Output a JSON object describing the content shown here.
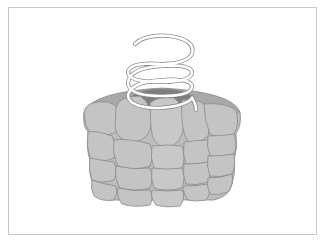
{
  "figure": {
    "colors": {
      "background": "#ffffff",
      "frame_border": "#c8c8c8",
      "subunit_fill": "#c4c4c4",
      "subunit_stroke": "#8a8a8a",
      "rim_fill": "#a9a9a9",
      "pore_fill": "#7d7d7d",
      "helix_fill": "#ffffff",
      "helix_stroke": "#8a8a8a"
    },
    "layers": 4
  }
}
